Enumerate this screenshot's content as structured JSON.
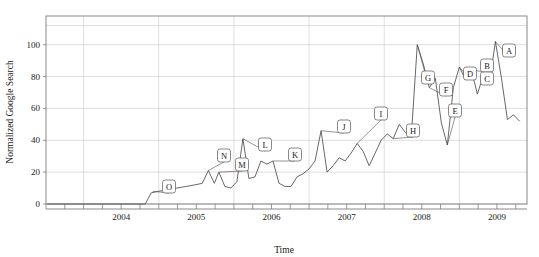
{
  "chart_data": {
    "type": "line",
    "title": "",
    "xlabel": "Time",
    "ylabel": "Normalized Google Search",
    "xlim": [
      2003.5,
      2009.9
    ],
    "ylim": [
      0,
      118
    ],
    "grid": true,
    "legend_position": "none",
    "y_ticks": [
      0,
      20,
      40,
      60,
      80,
      100
    ],
    "y_tick_labels": [
      "0",
      "20",
      "40",
      "60",
      "80",
      "100"
    ],
    "x_ticks": [
      2004,
      2005,
      2006,
      2007,
      2008,
      2009
    ],
    "x_tick_labels": [
      "2004",
      "2005",
      "2006",
      "2007",
      "2008",
      "2009"
    ],
    "x_minor_tick_interval": 0.25,
    "series": [
      {
        "name": "Normalized Google Search",
        "x": [
          2003.52,
          2003.64,
          2003.76,
          2003.88,
          2004.0,
          2004.12,
          2004.24,
          2004.36,
          2004.48,
          2004.6,
          2004.72,
          2004.82,
          2004.9,
          2005.0,
          2005.12,
          2005.24,
          2005.36,
          2005.48,
          2005.58,
          2005.66,
          2005.74,
          2005.8,
          2005.88,
          2005.96,
          2006.04,
          2006.12,
          2006.2,
          2006.28,
          2006.36,
          2006.44,
          2006.52,
          2006.6,
          2006.68,
          2006.76,
          2006.84,
          2006.92,
          2007.0,
          2007.08,
          2007.16,
          2007.24,
          2007.32,
          2007.4,
          2007.48,
          2007.56,
          2007.64,
          2007.72,
          2007.8,
          2007.88,
          2007.96,
          2008.04,
          2008.12,
          2008.2,
          2008.28,
          2008.36,
          2008.44,
          2008.52,
          2008.6,
          2008.68,
          2008.76,
          2008.84,
          2008.92,
          2009.0,
          2009.08,
          2009.16,
          2009.24,
          2009.32,
          2009.4,
          2009.48,
          2009.56,
          2009.64,
          2009.72,
          2009.8
        ],
        "y": [
          0,
          0,
          0,
          0,
          0,
          0,
          0,
          0,
          0,
          0,
          0,
          0,
          7,
          8,
          9,
          10,
          11,
          12,
          13,
          21,
          13,
          20,
          11,
          10,
          14,
          41,
          16,
          17,
          27,
          25,
          27,
          13,
          11,
          11,
          17,
          19,
          22,
          27,
          46,
          20,
          24,
          29,
          27,
          32,
          38,
          33,
          24,
          32,
          40,
          44,
          41,
          50,
          45,
          42,
          100,
          88,
          73,
          79,
          51,
          37,
          73,
          86,
          78,
          84,
          69,
          81,
          76,
          102,
          79,
          53,
          56,
          52
        ]
      }
    ],
    "annotations": [
      {
        "label": "O",
        "point_x": 2004.92,
        "point_y": 8,
        "box_x": 169,
        "box_y": 180
      },
      {
        "label": "N",
        "point_x": 2005.66,
        "point_y": 21,
        "box_x": 224,
        "box_y": 149
      },
      {
        "label": "M",
        "point_x": 2005.8,
        "point_y": 20,
        "box_x": 242,
        "box_y": 158
      },
      {
        "label": "L",
        "point_x": 2006.12,
        "point_y": 41,
        "box_x": 265,
        "box_y": 138
      },
      {
        "label": "K",
        "point_x": 2006.52,
        "point_y": 27,
        "box_x": 295,
        "box_y": 148
      },
      {
        "label": "J",
        "point_x": 2007.16,
        "point_y": 46,
        "box_x": 344,
        "box_y": 120
      },
      {
        "label": "I",
        "point_x": 2007.64,
        "point_y": 38,
        "box_x": 381,
        "box_y": 107
      },
      {
        "label": "H",
        "point_x": 2008.12,
        "point_y": 41,
        "box_x": 413,
        "box_y": 124
      },
      {
        "label": "G",
        "point_x": 2008.44,
        "point_y": 100,
        "box_x": 428,
        "box_y": 71
      },
      {
        "label": "F",
        "point_x": 2008.6,
        "point_y": 73,
        "box_x": 446,
        "box_y": 83
      },
      {
        "label": "E",
        "point_x": 2008.84,
        "point_y": 37,
        "box_x": 455,
        "box_y": 104
      },
      {
        "label": "D",
        "point_x": 2009.0,
        "point_y": 86,
        "box_x": 470,
        "box_y": 67
      },
      {
        "label": "B",
        "point_x": 2009.16,
        "point_y": 84,
        "box_x": 487,
        "box_y": 59
      },
      {
        "label": "C",
        "point_x": 2009.32,
        "point_y": 81,
        "box_x": 487,
        "box_y": 72
      },
      {
        "label": "A",
        "point_x": 2009.48,
        "point_y": 102,
        "box_x": 509,
        "box_y": 44
      }
    ],
    "colors": {
      "line": "#4d4d4d",
      "grid": "#c8c8c8",
      "frame": "#7d7d7d",
      "background": "#ffffff",
      "text": "#1a1a1a"
    }
  }
}
